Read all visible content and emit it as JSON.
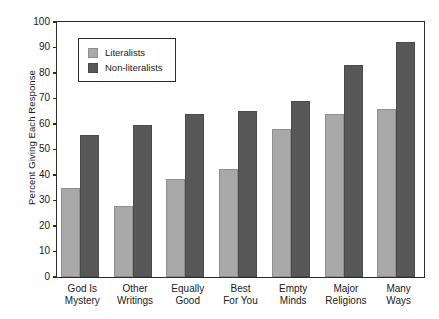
{
  "chart_data": {
    "type": "bar",
    "title": "",
    "xlabel": "",
    "ylabel": "Percent Giving Each Response",
    "ylim": [
      0,
      100
    ],
    "ytick_step": 10,
    "yticks": [
      0,
      10,
      20,
      30,
      40,
      50,
      60,
      70,
      80,
      90,
      100
    ],
    "grid": false,
    "legend_position": "upper-left-inside",
    "categories": [
      "God Is Mystery",
      "Other Writings",
      "Equally Good",
      "Best For You",
      "Empty Minds",
      "Major Religions",
      "Many Ways"
    ],
    "category_lines": [
      [
        "God Is",
        "Mystery"
      ],
      [
        "Other",
        "Writings"
      ],
      [
        "Equally",
        "Good"
      ],
      [
        "Best",
        "For You"
      ],
      [
        "Empty",
        "Minds"
      ],
      [
        "Major",
        "Religions"
      ],
      [
        "Many",
        "Ways"
      ]
    ],
    "series": [
      {
        "name": "Literalists",
        "color": "#a9a9a9",
        "values": [
          35,
          28,
          38.5,
          42.5,
          58,
          64,
          66
        ]
      },
      {
        "name": "Non-literalists",
        "color": "#585858",
        "values": [
          55.5,
          59.5,
          64,
          65,
          69,
          83,
          92
        ]
      }
    ]
  },
  "legend": {
    "items": [
      {
        "label": "Literalists"
      },
      {
        "label": "Non-literalists"
      }
    ]
  },
  "colors": {
    "literalists": "#a9a9a9",
    "non_literalists": "#585858",
    "axis": "#2b2b2b",
    "background": "#ffffff"
  }
}
